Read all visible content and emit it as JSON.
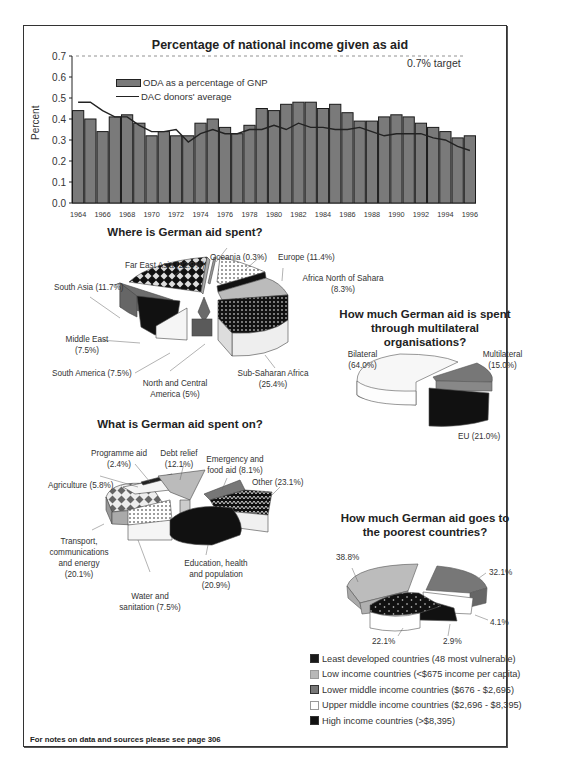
{
  "chart_data": [
    {
      "type": "bar",
      "title": "Percentage of national income given as aid",
      "xlabel": "",
      "ylabel": "Percent",
      "ylim": [
        0.0,
        0.7
      ],
      "yticks": [
        "0.0",
        "0.1",
        "0.2",
        "0.3",
        "0.4",
        "0.5",
        "0.6",
        "0.7"
      ],
      "xtick_labels": [
        "1964",
        "1966",
        "1968",
        "1970",
        "1972",
        "1974",
        "1976",
        "1978",
        "1980",
        "1982",
        "1984",
        "1986",
        "1988",
        "1990",
        "1992",
        "1994",
        "1996"
      ],
      "categories": [
        "1964",
        "1965",
        "1966",
        "1967",
        "1968",
        "1969",
        "1970",
        "1971",
        "1972",
        "1973",
        "1974",
        "1975",
        "1976",
        "1977",
        "1978",
        "1979",
        "1980",
        "1981",
        "1982",
        "1983",
        "1984",
        "1985",
        "1986",
        "1987",
        "1988",
        "1989",
        "1990",
        "1991",
        "1992",
        "1993",
        "1994",
        "1995",
        "1996"
      ],
      "series": [
        {
          "name": "ODA as a percentage of GNP",
          "kind": "bar",
          "values": [
            0.44,
            0.4,
            0.34,
            0.41,
            0.42,
            0.38,
            0.32,
            0.34,
            0.32,
            0.32,
            0.38,
            0.4,
            0.36,
            0.33,
            0.37,
            0.45,
            0.44,
            0.47,
            0.48,
            0.48,
            0.45,
            0.47,
            0.43,
            0.39,
            0.39,
            0.41,
            0.42,
            0.41,
            0.38,
            0.36,
            0.34,
            0.31,
            0.32
          ]
        },
        {
          "name": "DAC donors' average",
          "kind": "line",
          "values": [
            0.48,
            0.48,
            0.44,
            0.41,
            0.41,
            0.37,
            0.34,
            0.34,
            0.35,
            0.29,
            0.33,
            0.35,
            0.33,
            0.33,
            0.35,
            0.35,
            0.37,
            0.35,
            0.38,
            0.36,
            0.36,
            0.35,
            0.35,
            0.36,
            0.34,
            0.32,
            0.33,
            0.33,
            0.33,
            0.31,
            0.3,
            0.27,
            0.25
          ]
        }
      ],
      "annotations": [
        {
          "text": "0.7% target",
          "y": 0.7,
          "style": "dashed line"
        }
      ],
      "legend_position": "upper left",
      "grid": false
    },
    {
      "type": "pie",
      "title": "Where is German aid spent?",
      "categories": [
        "Far East Asia",
        "Oceania",
        "Europe",
        "Africa North of Sahara",
        "Sub-Saharan Africa",
        "North and Central America",
        "South America",
        "Middle East",
        "South Asia"
      ],
      "values": [
        22.9,
        0.3,
        11.4,
        8.3,
        25.4,
        5.0,
        7.5,
        7.5,
        11.7
      ]
    },
    {
      "type": "pie",
      "title": "How much German aid is spent through multilateral organisations?",
      "categories": [
        "Bilateral",
        "Multilateral",
        "EU"
      ],
      "values": [
        64.0,
        15.0,
        21.0
      ]
    },
    {
      "type": "pie",
      "title": "What is German aid spent on?",
      "categories": [
        "Programme aid",
        "Debt relief",
        "Emergency and food aid",
        "Other",
        "Education, health and population",
        "Water and sanitation",
        "Transport, communications and energy",
        "Agriculture"
      ],
      "values": [
        2.4,
        12.1,
        8.1,
        23.1,
        20.9,
        7.5,
        20.1,
        5.8
      ]
    },
    {
      "type": "pie",
      "title": "How much German aid goes to the poorest countries?",
      "categories": [
        "Least developed countries (48 most vulnerable)",
        "Low income countries (<$675 income per capita)",
        "Lower middle income countries ($676 - $2,695)",
        "Upper middle income countries ($2,696 - $8,395)",
        "High income countries (>$8,395)"
      ],
      "values": [
        22.1,
        38.8,
        32.1,
        4.1,
        2.9
      ]
    }
  ],
  "bar_chart": {
    "title": "Percentage of national income given as aid",
    "ylabel": "Percent",
    "target_label": "0.7% target",
    "legend": {
      "bar": "ODA as a percentage of GNP",
      "line": "DAC donors' average"
    },
    "colors": {
      "bar": "#7a7a7a",
      "line": "#222222"
    }
  },
  "where_spent": {
    "title": "Where is German aid spent?",
    "labels": {
      "far_east": "Far East Asia (22.9%)",
      "oceania": "Oceania (0.3%)",
      "europe": "Europe (11.4%)",
      "africa_north_1": "Africa North of Sahara",
      "africa_north_2": "(8.3%)",
      "south_asia": "South Asia (11.7%)",
      "middle_east_1": "Middle East",
      "middle_east_2": "(7.5%)",
      "south_america": "South America (7.5%)",
      "ncamerica_1": "North and Central",
      "ncamerica_2": "America (5%)",
      "subsaharan_1": "Sub-Saharan Africa",
      "subsaharan_2": "(25.4%)"
    }
  },
  "multilateral": {
    "title_1": "How much German aid is spent",
    "title_2": "through multilateral",
    "title_3": "organisations?",
    "labels": {
      "bilateral_1": "Bilateral",
      "bilateral_2": "(64.0%)",
      "multilateral_1": "Multilateral",
      "multilateral_2": "(15.0%)",
      "eu": "EU (21.0%)"
    }
  },
  "spent_on": {
    "title": "What is German aid spent on?",
    "labels": {
      "programme_1": "Programme aid",
      "programme_2": "(2.4%)",
      "debt_1": "Debt relief",
      "debt_2": "(12.1%)",
      "emergency_1": "Emergency and",
      "emergency_2": "food aid (8.1%)",
      "other": "Other (23.1%)",
      "agriculture": "Agriculture (5.8%)",
      "transport_1": "Transport,",
      "transport_2": "communications",
      "transport_3": "and energy",
      "transport_4": "(20.1%)",
      "education_1": "Education, health",
      "education_2": "and population",
      "education_3": "(20.9%)",
      "water_1": "Water and",
      "water_2": "sanitation (7.5%)"
    }
  },
  "poorest": {
    "title_1": "How much German aid goes to",
    "title_2": "the poorest countries?",
    "labels": {
      "low": "38.8%",
      "lower_middle": "32.1%",
      "upper_middle": "4.1%",
      "high": "2.9%",
      "least": "22.1%"
    },
    "legend": [
      {
        "label": "Least developed countries (48 most vulnerable)",
        "color": "#1a1a1a"
      },
      {
        "label": "Low income countries (<$675 income per capita)",
        "color": "#b8b8b8"
      },
      {
        "label": "Lower middle income countries ($676 - $2,695)",
        "color": "#777777"
      },
      {
        "label": "Upper middle income countries ($2,696 - $8,395)",
        "color": "#ffffff"
      },
      {
        "label": "High income countries (>$8,395)",
        "color": "#111111"
      }
    ]
  },
  "footer": {
    "note": "For notes on data and sources please see page 306"
  }
}
